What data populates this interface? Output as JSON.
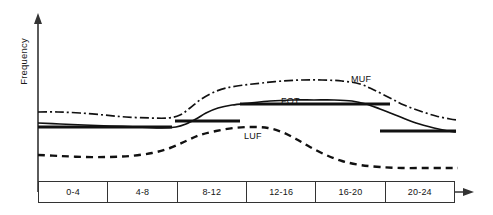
{
  "chart_data": {
    "type": "line",
    "title": "",
    "xlabel": "",
    "ylabel": "Frequency",
    "grid": false,
    "legend_position": "inline-annotations",
    "x_categories": [
      "0-4",
      "4-8",
      "8-12",
      "12-16",
      "16-20",
      "20-24"
    ],
    "x_axis_note": "Time of day in hours (UTC), 4-hour blocks",
    "y_axis_note": "Frequency, unlabeled qualitative scale increasing upward",
    "series": [
      {
        "name": "MUF",
        "label": "MUF",
        "style": "dash-dot",
        "color": "#111111",
        "label_x": 351,
        "label_y": 74,
        "points": [
          [
            38,
            112
          ],
          [
            58,
            112
          ],
          [
            80,
            113
          ],
          [
            104,
            115
          ],
          [
            126,
            117
          ],
          [
            150,
            118
          ],
          [
            168,
            118
          ],
          [
            180,
            115
          ],
          [
            190,
            108
          ],
          [
            200,
            100
          ],
          [
            212,
            93
          ],
          [
            226,
            88
          ],
          [
            244,
            85
          ],
          [
            262,
            83
          ],
          [
            282,
            81
          ],
          [
            302,
            80
          ],
          [
            322,
            80
          ],
          [
            342,
            81
          ],
          [
            360,
            84
          ],
          [
            374,
            90
          ],
          [
            390,
            98
          ],
          [
            404,
            105
          ],
          [
            420,
            111
          ],
          [
            436,
            116
          ],
          [
            450,
            119
          ],
          [
            458,
            120
          ]
        ]
      },
      {
        "name": "FOT",
        "label": "FOT",
        "style": "solid",
        "color": "#111111",
        "label_x": 281,
        "label_y": 96,
        "points": [
          [
            38,
            123
          ],
          [
            60,
            124
          ],
          [
            84,
            125
          ],
          [
            110,
            126
          ],
          [
            138,
            127
          ],
          [
            162,
            128
          ],
          [
            176,
            127
          ],
          [
            186,
            124
          ],
          [
            196,
            119
          ],
          [
            206,
            113
          ],
          [
            218,
            108
          ],
          [
            232,
            105
          ],
          [
            250,
            103
          ],
          [
            270,
            101
          ],
          [
            292,
            100
          ],
          [
            314,
            100
          ],
          [
            334,
            100
          ],
          [
            352,
            101
          ],
          [
            366,
            104
          ],
          [
            380,
            109
          ],
          [
            398,
            116
          ],
          [
            416,
            123
          ],
          [
            434,
            128
          ],
          [
            448,
            131
          ],
          [
            456,
            132
          ]
        ]
      },
      {
        "name": "LUF",
        "label": "LUF",
        "style": "dashed",
        "color": "#111111",
        "label_x": 244,
        "label_y": 131,
        "points": [
          [
            38,
            155
          ],
          [
            60,
            156
          ],
          [
            84,
            157
          ],
          [
            108,
            157
          ],
          [
            130,
            156
          ],
          [
            152,
            153
          ],
          [
            170,
            148
          ],
          [
            186,
            141
          ],
          [
            200,
            135
          ],
          [
            216,
            131
          ],
          [
            234,
            128
          ],
          [
            252,
            127
          ],
          [
            268,
            128
          ],
          [
            282,
            132
          ],
          [
            296,
            139
          ],
          [
            310,
            147
          ],
          [
            326,
            155
          ],
          [
            342,
            161
          ],
          [
            360,
            165
          ],
          [
            380,
            167
          ],
          [
            402,
            168
          ],
          [
            424,
            168
          ],
          [
            444,
            168
          ],
          [
            458,
            168
          ]
        ]
      }
    ],
    "shelf_bars": [
      {
        "name": "fot-shelf-left",
        "x1": 38,
        "x2": 172,
        "y": 127
      },
      {
        "name": "fot-shelf-mid-low",
        "x1": 175,
        "x2": 240,
        "y": 121
      },
      {
        "name": "fot-shelf-mid-high",
        "x1": 240,
        "x2": 390,
        "y": 104
      },
      {
        "name": "fot-shelf-right",
        "x1": 380,
        "x2": 456,
        "y": 131
      }
    ],
    "axes": {
      "y_axis_x": 38,
      "y_axis_top": 15,
      "y_axis_bottom": 192,
      "x_axis_y": 192,
      "x_axis_left": 38,
      "x_axis_right": 472,
      "arrow_y_name": "y-axis-arrowhead",
      "arrow_x_name": "x-axis-arrowhead"
    }
  },
  "labels": {
    "y_axis_title": "Frequency",
    "muf": "MUF",
    "fot": "FOT",
    "luf": "LUF"
  },
  "legend_table": {
    "cells": [
      "0-4",
      "4-8",
      "8-12",
      "12-16",
      "16-20",
      "20-24"
    ]
  },
  "colors": {
    "ink": "#111111",
    "axis": "#333333",
    "background": "#ffffff"
  }
}
